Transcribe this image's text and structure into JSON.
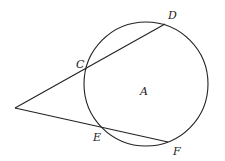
{
  "diagram": {
    "title": "",
    "stroke_color": "#222222",
    "background": "#ffffff",
    "circle": {
      "center_label": "A",
      "cx": 146,
      "cy": 84,
      "r": 62
    },
    "external_point": {
      "x": 15,
      "y": 108,
      "label": ""
    },
    "secants": [
      {
        "name": "secant-CD",
        "near_point": "C",
        "far_point": "D"
      },
      {
        "name": "secant-EF",
        "near_point": "E",
        "far_point": "F"
      }
    ],
    "points": {
      "C": {
        "label": "C",
        "x": 85,
        "y": 67,
        "label_x": 76,
        "label_y": 68
      },
      "D": {
        "label": "D",
        "x": 165,
        "y": 24,
        "label_x": 168,
        "label_y": 19
      },
      "E": {
        "label": "E",
        "x": 102,
        "y": 127,
        "label_x": 94,
        "label_y": 141
      },
      "F": {
        "label": "F",
        "x": 168,
        "y": 142,
        "label_x": 174,
        "label_y": 155
      },
      "A": {
        "label": "A",
        "x": 143,
        "y": 95
      }
    }
  }
}
